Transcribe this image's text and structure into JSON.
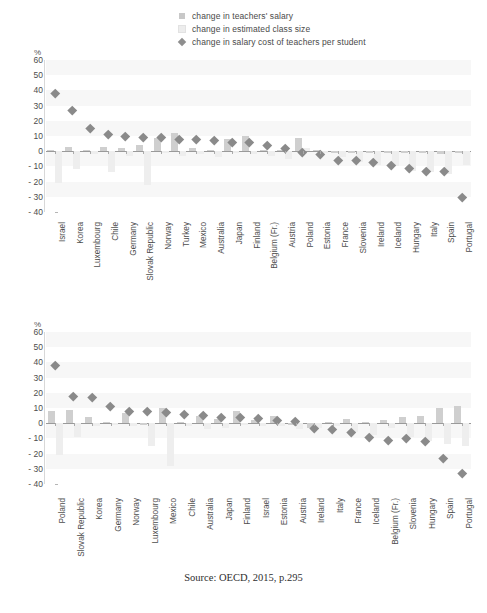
{
  "legend": {
    "items": [
      {
        "icon": "square-marker-icon",
        "label": "change in teachers' salary",
        "color": "#c8c8c8"
      },
      {
        "icon": "square-light-marker-icon",
        "label": "change in estimated class size",
        "color": "#ededed"
      },
      {
        "icon": "diamond-marker-icon",
        "label": "change in salary cost of teachers per student",
        "color": "#8e8e8e"
      }
    ]
  },
  "source": "Source: OECD, 2015, p.295",
  "axis": {
    "unit": "%",
    "ticks": [
      "60",
      "50",
      "40",
      "30",
      "20",
      "10",
      "0",
      "- 10",
      "- 20",
      "- 30",
      "- 40"
    ]
  },
  "chart_data": [
    {
      "type": "bar",
      "title": "Primary",
      "xlabel": "",
      "ylabel": "%",
      "ylim": [
        -40,
        60
      ],
      "yticks": [
        60,
        50,
        40,
        30,
        20,
        10,
        0,
        -10,
        -20,
        -30,
        -40
      ],
      "grid": true,
      "legend_position": "top",
      "categories": [
        "Israel",
        "Korea",
        "Luxembourg",
        "Chile",
        "Germany",
        "Slovak Republic",
        "Norway",
        "Turkey",
        "Mexico",
        "Australia",
        "Japan",
        "Finland",
        "Belgium (Fr.)",
        "Austria",
        "Poland",
        "Estonia",
        "France",
        "Slovenia",
        "Ireland",
        "Iceland",
        "Hungary",
        "Italy",
        "Spain",
        "Portugal"
      ],
      "series": [
        {
          "name": "change in teachers' salary",
          "values": [
            1,
            3,
            1,
            3,
            2,
            4,
            9,
            12,
            2,
            1,
            8,
            10,
            1,
            1,
            9,
            1,
            -1,
            -1,
            -1,
            -1,
            -1,
            -1,
            -2,
            -1
          ]
        },
        {
          "name": "change in estimated class size",
          "values": [
            -21,
            -12,
            -2,
            -14,
            -3,
            -22,
            -1,
            -3,
            -2,
            -4,
            -1,
            -2,
            -3,
            -5,
            2,
            -1,
            -4,
            -7,
            -9,
            -10,
            -13,
            -14,
            -15,
            -9
          ]
        },
        {
          "name": "change in salary cost of teachers per student",
          "values": [
            38,
            27,
            15,
            11,
            10,
            9,
            9,
            8,
            8,
            7,
            6,
            6,
            4,
            2,
            -1,
            -2,
            -6,
            -6,
            -7,
            -9,
            -11,
            -13,
            -13,
            -30
          ]
        }
      ]
    },
    {
      "type": "bar",
      "title": "Lower Secondary",
      "xlabel": "",
      "ylabel": "%",
      "ylim": [
        -40,
        60
      ],
      "yticks": [
        60,
        50,
        40,
        30,
        20,
        10,
        0,
        -10,
        -20,
        -30,
        -40
      ],
      "grid": true,
      "legend_position": "top",
      "categories": [
        "Poland",
        "Slovak Republic",
        "Korea",
        "Germany",
        "Norway",
        "Luxembourg",
        "Mexico",
        "Chile",
        "Australia",
        "Japan",
        "Finland",
        "Israel",
        "Estonia",
        "Austria",
        "Ireland",
        "Italy",
        "France",
        "Iceland",
        "Belgium (Fr.)",
        "Slovenia",
        "Hungary",
        "Spain",
        "Portugal"
      ],
      "series": [
        {
          "name": "change in teachers' salary",
          "values": [
            8,
            9,
            4,
            1,
            7,
            -1,
            10,
            1,
            5,
            3,
            8,
            2,
            5,
            -1,
            -3,
            1,
            3,
            1,
            2,
            4,
            5,
            10,
            11
          ]
        },
        {
          "name": "change in estimated class size",
          "values": [
            -21,
            -9,
            -2,
            -1,
            -2,
            -15,
            -28,
            -2,
            -4,
            -3,
            -1,
            -2,
            -2,
            -4,
            -3,
            -2,
            -6,
            -8,
            -3,
            -9,
            -12,
            -14,
            -15
          ]
        },
        {
          "name": "change in salary cost of teachers per student",
          "values": [
            38,
            18,
            17,
            11,
            8,
            8,
            7,
            6,
            5,
            4,
            4,
            3,
            2,
            1,
            -3,
            -4,
            -6,
            -9,
            -11,
            -10,
            -12,
            -23,
            -33
          ]
        }
      ]
    }
  ]
}
